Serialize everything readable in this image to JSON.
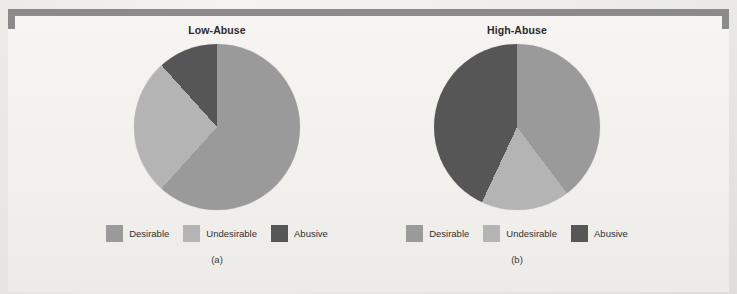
{
  "figure": {
    "background_color": "#f1f0ec",
    "bracket_color": "#8b8b8b"
  },
  "palette": {
    "desirable": "#9a9a9a",
    "undesirable": "#b4b4b4",
    "abusive": "#565656"
  },
  "panels": [
    {
      "id": "a",
      "title": "Low-Abuse",
      "subcaption": "(a)",
      "legend": [
        {
          "label": "Desirable",
          "color": "#9a9a9a",
          "icon": "legend-swatch"
        },
        {
          "label": "Undesirable",
          "color": "#b4b4b4",
          "icon": "legend-swatch"
        },
        {
          "label": "Abusive",
          "color": "#565656",
          "icon": "legend-swatch"
        }
      ],
      "gradient": "conic-gradient(from 0deg, #9a9a9a 0deg 222deg, #b4b4b4 222deg 318deg, #565656 318deg 360deg)"
    },
    {
      "id": "b",
      "title": "High-Abuse",
      "subcaption": "(b)",
      "legend": [
        {
          "label": "Desirable",
          "color": "#9a9a9a",
          "icon": "legend-swatch"
        },
        {
          "label": "Undesirable",
          "color": "#b4b4b4",
          "icon": "legend-swatch"
        },
        {
          "label": "Abusive",
          "color": "#565656",
          "icon": "legend-swatch"
        }
      ],
      "gradient": "conic-gradient(from 0deg, #9a9a9a 0deg 143deg, #b4b4b4 143deg 205deg, #565656 205deg 360deg)"
    }
  ],
  "chart_data": [
    {
      "type": "pie",
      "title": "Low-Abuse",
      "subcaption": "(a)",
      "categories": [
        "Desirable",
        "Undesirable",
        "Abusive"
      ],
      "values": [
        61.7,
        26.7,
        11.6
      ],
      "units": "percent",
      "start_angle_deg": 0,
      "direction": "clockwise",
      "slice_boundaries_deg": [
        0,
        222,
        318,
        360
      ],
      "colors": [
        "#9a9a9a",
        "#b4b4b4",
        "#565656"
      ],
      "legend_position": "bottom",
      "grid": false
    },
    {
      "type": "pie",
      "title": "High-Abuse",
      "subcaption": "(b)",
      "categories": [
        "Desirable",
        "Undesirable",
        "Abusive"
      ],
      "values": [
        39.7,
        17.2,
        43.1
      ],
      "units": "percent",
      "start_angle_deg": 0,
      "direction": "clockwise",
      "slice_boundaries_deg": [
        0,
        143,
        205,
        360
      ],
      "colors": [
        "#9a9a9a",
        "#b4b4b4",
        "#565656"
      ],
      "legend_position": "bottom",
      "grid": false
    }
  ]
}
